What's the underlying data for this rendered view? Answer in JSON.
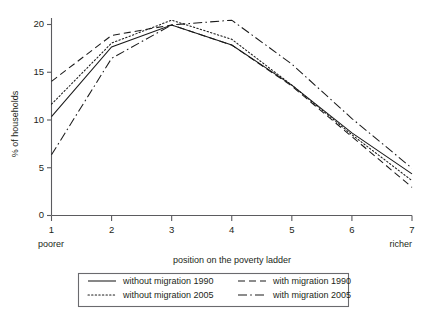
{
  "chart_data": {
    "type": "line",
    "title": "",
    "xlabel": "position on the poverty ladder",
    "ylabel": "% of households",
    "x": [
      1,
      2,
      3,
      4,
      5,
      6,
      7
    ],
    "xtick_labels": [
      "1",
      "2",
      "3",
      "4",
      "5",
      "6",
      "7"
    ],
    "ytick_labels": [
      "0",
      "5",
      "10",
      "15",
      "20"
    ],
    "ytick_values": [
      0,
      5,
      10,
      15,
      20
    ],
    "ylim": [
      0,
      21.5
    ],
    "xlim": [
      1,
      7
    ],
    "grid": false,
    "legend_position": "bottom",
    "x_axis_end_labels": {
      "left": "poorer",
      "right": "richer"
    },
    "series": [
      {
        "name": "without migration 1990",
        "dash": "solid",
        "values": [
          10.3,
          17.6,
          19.9,
          17.8,
          13.6,
          8.6,
          4.3
        ]
      },
      {
        "name": "with migration 1990",
        "dash": "dashed",
        "values": [
          14.0,
          18.8,
          19.9,
          17.8,
          13.5,
          8.2,
          2.9
        ]
      },
      {
        "name": "without migration 2005",
        "dash": "dotted",
        "values": [
          11.6,
          18.0,
          20.4,
          18.4,
          13.6,
          8.4,
          3.6
        ]
      },
      {
        "name": "with migration 2005",
        "dash": "dashdot",
        "values": [
          6.3,
          16.4,
          19.9,
          20.4,
          15.8,
          10.1,
          4.9
        ]
      }
    ]
  },
  "axes": {
    "ylabel": "% of households",
    "xlabel": "position on the poverty ladder",
    "poorer_label": "poorer",
    "richer_label": "richer",
    "yticks": [
      "20",
      "15",
      "10",
      "5",
      "0"
    ],
    "xticks": [
      "1",
      "2",
      "3",
      "4",
      "5",
      "6",
      "7"
    ]
  },
  "legend": {
    "entries": [
      {
        "label": "without migration 1990",
        "style": "solid"
      },
      {
        "label": "with migration 1990",
        "style": "dashed"
      },
      {
        "label": "without migration 2005",
        "style": "dotted"
      },
      {
        "label": "with migration 2005",
        "style": "dashdot"
      }
    ]
  },
  "colors": {
    "line": "#1a1a1a",
    "axis": "#5b5b5f",
    "text": "#231f20",
    "background": "#ffffff"
  }
}
